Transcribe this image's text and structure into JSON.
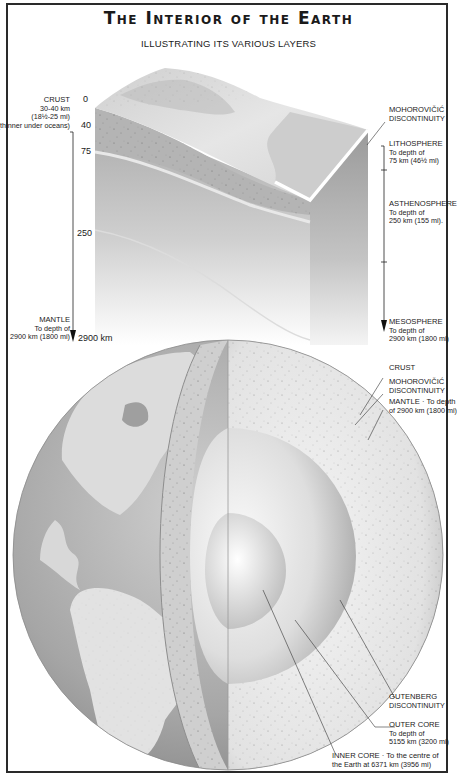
{
  "title": "The Interior of the Earth",
  "subtitle": "ILLUSTRATING ITS VARIOUS LAYERS",
  "depth_scale": {
    "ticks": [
      {
        "label": "0",
        "unit": ""
      },
      {
        "label": "40",
        "unit": ""
      },
      {
        "label": "75",
        "unit": ""
      },
      {
        "label": "250",
        "unit": ""
      },
      {
        "label": "2900 km",
        "unit": "km"
      }
    ]
  },
  "left_labels": {
    "crust": {
      "heading": "CRUST",
      "lines": [
        "30-40 km",
        "(18½-25 mi)",
        "(thinner under oceans)"
      ]
    },
    "mantle": {
      "heading": "MANTLE",
      "lines": [
        "To depth of",
        "2900 km (1800 mi)"
      ]
    }
  },
  "right_labels": {
    "mohorovicic_top": {
      "heading": "MOHOROVIČIĆ",
      "lines": [
        "DISCONTINUITY"
      ]
    },
    "lithosphere": {
      "heading": "LITHOSPHERE",
      "lines": [
        "To depth of",
        "75 km (46½ mi)"
      ]
    },
    "asthenosphere": {
      "heading": "ASTHENOSPHERE",
      "lines": [
        "To depth of",
        "250 km (155 mi)."
      ]
    },
    "mesosphere": {
      "heading": "MESOSPHERE",
      "lines": [
        "To depth of",
        "2900 km (1800 mi)"
      ]
    },
    "crust": {
      "heading": "CRUST",
      "lines": []
    },
    "mohorovicic_sphere": {
      "heading": "MOHOROVIČIĆ",
      "lines": [
        "DISCONTINUITY"
      ]
    },
    "mantle": {
      "heading": "MANTLE · To depth",
      "lines": [
        "of 2900 km (1800 mi)"
      ]
    },
    "gutenberg": {
      "heading": "GUTENBERG",
      "lines": [
        "DISCONTINUITY"
      ]
    },
    "outer_core": {
      "heading": "OUTER CORE",
      "lines": [
        "To depth of",
        "5155 km (3200 mi)"
      ]
    },
    "inner_core": {
      "heading": "INNER CORE · To the centre of",
      "lines": [
        "the Earth at 6371 km (3956 mi)"
      ]
    }
  },
  "colors": {
    "frame": "#2a2a2a",
    "text": "#1a1a1a",
    "ocean": "#9d9d9d",
    "land": "#dedede",
    "mantle": "#e6e6e6",
    "core": "#c9c9c9"
  }
}
